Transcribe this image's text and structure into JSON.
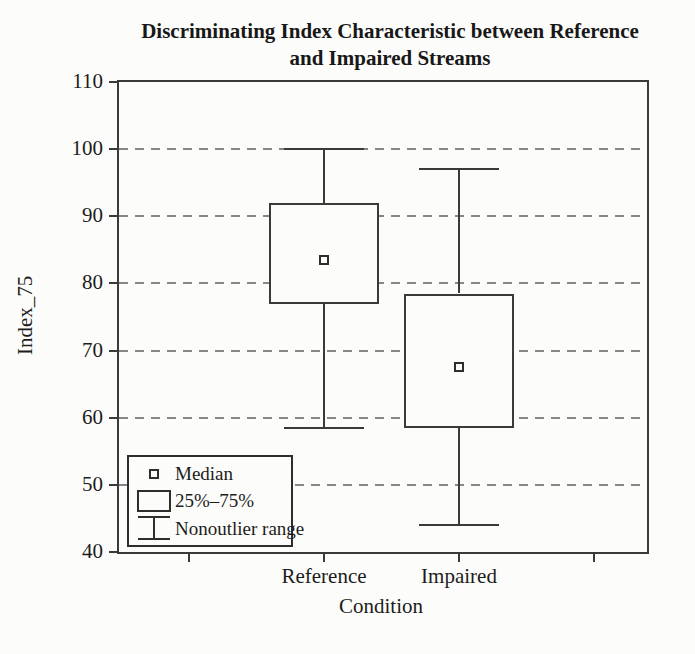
{
  "title": {
    "line1": "Discriminating Index Characteristic between Reference",
    "line2": "and Impaired Streams"
  },
  "axes": {
    "y_label": "Index_75",
    "x_label": "Condition"
  },
  "legend": {
    "items": [
      {
        "symbol": "median-square-marker",
        "label": "Median"
      },
      {
        "symbol": "iqr-box",
        "label": "25%–75%"
      },
      {
        "symbol": "whisker-range",
        "label": "Nonoutlier range"
      }
    ]
  },
  "colors": {
    "line": "#3a3a3a",
    "grid": "#868686",
    "text": "#1c1c1c",
    "background": "#fcfcfa"
  },
  "chart_data": {
    "type": "box",
    "title": "Discriminating Index Characteristic between Reference and Impaired Streams",
    "xlabel": "Condition",
    "ylabel": "Index_75",
    "ylim": [
      40,
      110
    ],
    "yticks": [
      110,
      100,
      90,
      80,
      70,
      60,
      50,
      40
    ],
    "grid": "horizontal-dashed",
    "legend_position": "inside-bottom-left",
    "categories": [
      "Reference",
      "Impaired"
    ],
    "series": [
      {
        "name": "Reference",
        "median": 83.5,
        "q1": 77,
        "q3": 92,
        "whisker_low": 58.5,
        "whisker_high": 100
      },
      {
        "name": "Impaired",
        "median": 67.5,
        "q1": 58.5,
        "q3": 78.5,
        "whisker_low": 44,
        "whisker_high": 97
      }
    ]
  }
}
